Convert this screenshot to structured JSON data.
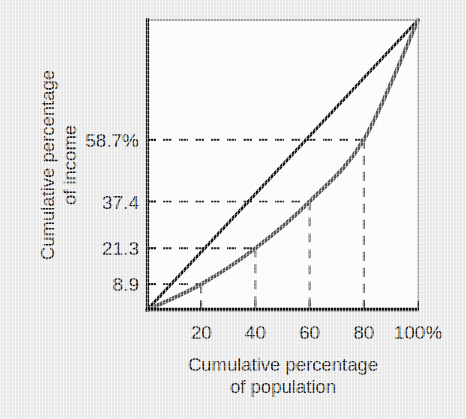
{
  "chart_data": {
    "type": "line",
    "title": "",
    "xlabel": "Cumulative percentage of population",
    "ylabel": "Cumulative percentage of income",
    "xlabel_lines": [
      "Cumulative percentage",
      "of population"
    ],
    "ylabel_lines": [
      "Cumulative percentage",
      "of income"
    ],
    "xlim": [
      0,
      100
    ],
    "ylim": [
      0,
      100
    ],
    "grid": false,
    "legend": "none",
    "x_ticks": [
      {
        "value": 20,
        "label": "20"
      },
      {
        "value": 40,
        "label": "40"
      },
      {
        "value": 60,
        "label": "60"
      },
      {
        "value": 80,
        "label": "80"
      },
      {
        "value": 100,
        "label": "100%"
      }
    ],
    "y_ticks": [
      {
        "value": 8.9,
        "label": "8.9"
      },
      {
        "value": 21.3,
        "label": "21.3"
      },
      {
        "value": 37.4,
        "label": "37.4"
      },
      {
        "value": 58.7,
        "label": "58.7%"
      }
    ],
    "series": [
      {
        "name": "Line of equality",
        "color": "#111111",
        "style": "solid",
        "x": [
          0,
          100
        ],
        "values": [
          0,
          100
        ]
      },
      {
        "name": "Lorenz curve",
        "color": "#545454",
        "style": "solid",
        "x": [
          0,
          20,
          40,
          60,
          80,
          100
        ],
        "values": [
          0,
          8.9,
          21.3,
          37.4,
          58.7,
          100
        ]
      }
    ],
    "annotations": {
      "guide_lines": [
        {
          "x": 20,
          "y": 8.9,
          "style": "dashed"
        },
        {
          "x": 40,
          "y": 21.3,
          "style": "dashed"
        },
        {
          "x": 60,
          "y": 37.4,
          "style": "dashed"
        },
        {
          "x": 80,
          "y": 58.7,
          "style": "dashed"
        }
      ],
      "guide_color": "#2a2a2a"
    },
    "colors": {
      "background": "#ececec",
      "plot_background": "#ffffff",
      "frame": "#111111",
      "equality_line": "#111111",
      "lorenz_curve": "#545454",
      "text": "#1b1b1b"
    }
  }
}
